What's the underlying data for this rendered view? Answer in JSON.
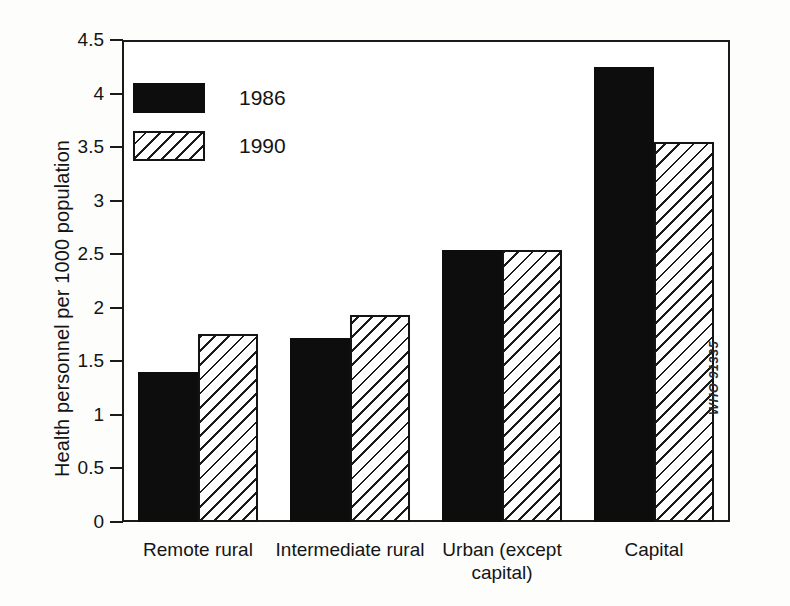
{
  "chart_data": {
    "type": "bar",
    "title": "",
    "xlabel": "",
    "ylabel": "Health personnel per 1000 population",
    "ylim": [
      0,
      4.5
    ],
    "yticks": [
      "0",
      "0.5",
      "1",
      "1.5",
      "2",
      "2.5",
      "3",
      "3.5",
      "4",
      "4.5"
    ],
    "ytick_values": [
      0,
      0.5,
      1,
      1.5,
      2,
      2.5,
      3,
      3.5,
      4,
      4.5
    ],
    "grid": false,
    "legend_position": "upper-left-inside",
    "categories": [
      "Remote rural",
      "Intermediate rural",
      "Urban (except capital)",
      "Capital"
    ],
    "series": [
      {
        "name": "1986",
        "pattern": "solid",
        "values": [
          1.4,
          1.72,
          2.54,
          4.25
        ]
      },
      {
        "name": "1990",
        "pattern": "diagonal-hatch",
        "values": [
          1.76,
          1.93,
          2.54,
          3.55
        ]
      }
    ],
    "annotations": [
      "WHO 91335"
    ]
  },
  "axis": {
    "y_title": "Health personnel per 1000 population",
    "ticks": [
      {
        "label": "4.5",
        "value": 4.5
      },
      {
        "label": "4",
        "value": 4
      },
      {
        "label": "3.5",
        "value": 3.5
      },
      {
        "label": "3",
        "value": 3
      },
      {
        "label": "2.5",
        "value": 2.5
      },
      {
        "label": "2",
        "value": 2
      },
      {
        "label": "1.5",
        "value": 1.5
      },
      {
        "label": "1",
        "value": 1
      },
      {
        "label": "0.5",
        "value": 0.5
      },
      {
        "label": "0",
        "value": 0
      }
    ]
  },
  "legend": {
    "entries": [
      {
        "label": "1986",
        "swatch": "solid"
      },
      {
        "label": "1990",
        "swatch": "diagonal-hatch"
      }
    ]
  },
  "x_labels": [
    {
      "line1": "Remote rural",
      "line2": ""
    },
    {
      "line1": "Intermediate rural",
      "line2": ""
    },
    {
      "line1": "Urban (except",
      "line2": "capital)"
    },
    {
      "line1": "Capital",
      "line2": ""
    }
  ],
  "watermark": "WHO 91335",
  "colors": {
    "series_1986": "#0d0d0d",
    "series_1990_outline": "#141414",
    "series_1990_fill": "#ffffff",
    "axis": "#1a1a1a",
    "background": "#ffffff"
  }
}
